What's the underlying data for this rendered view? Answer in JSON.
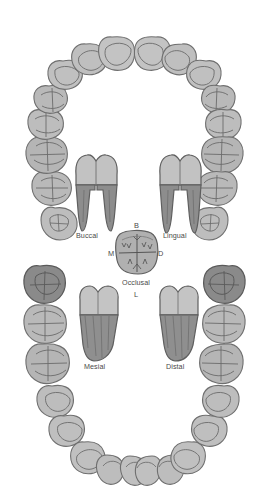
{
  "figure": {
    "background_color": "#ffffff",
    "style": "grayscale line illustration"
  },
  "palette": {
    "crown_fill": "#b9b9b9",
    "crown_fill_light": "#c6c6c6",
    "crown_fill_mid": "#b0b0b0",
    "root_fill": "#8f8f8f",
    "root_fill_dark": "#7e7e7e",
    "highlight_fill": "#8a8a8a",
    "outline": "#6f6f6f",
    "fissure": "#6b6b6b",
    "label_color": "#4a4a4a"
  },
  "surface_views": [
    {
      "id": "buccal",
      "label": "Buccal",
      "root_count": 2,
      "description": "two-rooted molar seen from the cheek side"
    },
    {
      "id": "lingual",
      "label": "Lingual",
      "root_count": 2,
      "description": "two-rooted molar seen from the tongue side"
    },
    {
      "id": "occlusal",
      "label": "Occlusal",
      "root_count": 0,
      "description": "chewing surface with fissure pattern"
    },
    {
      "id": "mesial",
      "label": "Mesial",
      "root_count": 1,
      "description": "tooth seen from the side toward the midline"
    },
    {
      "id": "distal",
      "label": "Distal",
      "root_count": 1,
      "description": "tooth seen from the side away from the midline"
    }
  ],
  "compass": {
    "description": "orientation letters around the occlusal view",
    "top": {
      "letter": "B",
      "meaning": "Buccal"
    },
    "left": {
      "letter": "M",
      "meaning": "Mesial"
    },
    "right": {
      "letter": "D",
      "meaning": "Distal"
    },
    "bottom": {
      "letter": "L",
      "meaning": "Lingual"
    }
  },
  "arches": [
    {
      "id": "maxillary",
      "name": "Upper arch",
      "position": "top",
      "tooth_count": 16,
      "anterior_shape": "triangular incisal outlines",
      "posterior_shape": "rounded molars with fissure patterns",
      "highlighted_teeth": []
    },
    {
      "id": "mandibular",
      "name": "Lower arch",
      "position": "bottom",
      "tooth_count": 16,
      "anterior_shape": "triangular incisal outlines",
      "posterior_shape": "rounded molars with fissure patterns",
      "highlighted_teeth": [
        "left third molar",
        "right third molar"
      ]
    }
  ]
}
